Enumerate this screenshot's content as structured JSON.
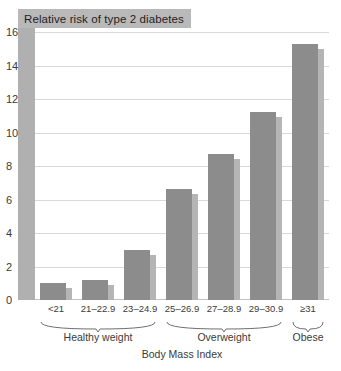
{
  "chart_data": {
    "type": "bar",
    "title": "Relative risk of type 2 diabetes",
    "xlabel": "Body Mass Index",
    "ylabel": "",
    "ylim": [
      0,
      16
    ],
    "yticks": [
      0,
      2,
      4,
      6,
      8,
      10,
      12,
      14,
      16
    ],
    "ytick_labels": [
      "0",
      "2",
      "4",
      "6",
      "8",
      "10",
      "12",
      "14",
      "16"
    ],
    "grid": true,
    "legend": "none",
    "categories": [
      "<21",
      "21–22.9",
      "23–24.9",
      "25–26.9",
      "27–28.9",
      "29–30.9",
      "≥31"
    ],
    "values": [
      1.0,
      1.2,
      3.0,
      6.6,
      8.7,
      11.2,
      15.3
    ],
    "groups": [
      {
        "label": "Healthy weight",
        "categories": [
          "<21",
          "21–22.9",
          "23–24.9"
        ]
      },
      {
        "label": "Overweight",
        "categories": [
          "25–26.9",
          "27–28.9",
          "29–30.9"
        ]
      },
      {
        "label": "Obese",
        "categories": [
          "≥31"
        ]
      }
    ],
    "colors": {
      "bar": "#8c8c8c",
      "bar_shadow": "#b5b5b5",
      "title_box": "#b9b9b9",
      "left_band": "#b0b0b0",
      "gridline": "#d9d9d9",
      "text": "#3b3b3b",
      "background": "#ffffff"
    }
  }
}
